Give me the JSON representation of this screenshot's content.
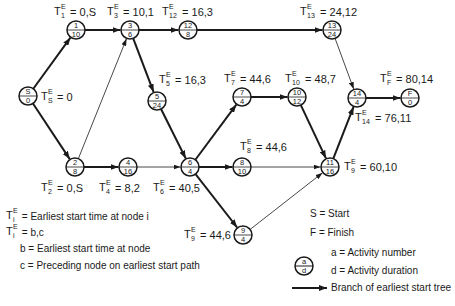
{
  "diagram": {
    "type": "network-earliest-start-tree",
    "nodes": [
      {
        "id": "S",
        "a": "S",
        "d": "0",
        "x": 28,
        "y": 96
      },
      {
        "id": "1",
        "a": "1",
        "d": "10",
        "x": 76,
        "y": 30
      },
      {
        "id": "2",
        "a": "2",
        "d": "8",
        "x": 75,
        "y": 167
      },
      {
        "id": "3",
        "a": "3",
        "d": "6",
        "x": 130,
        "y": 30
      },
      {
        "id": "12",
        "a": "12",
        "d": "8",
        "x": 188,
        "y": 30
      },
      {
        "id": "13",
        "a": "13",
        "d": "24",
        "x": 332,
        "y": 30
      },
      {
        "id": "5",
        "a": "5",
        "d": "24",
        "x": 157,
        "y": 101
      },
      {
        "id": "4",
        "a": "4",
        "d": "16",
        "x": 128,
        "y": 167
      },
      {
        "id": "6",
        "a": "6",
        "d": "4",
        "x": 190,
        "y": 167
      },
      {
        "id": "7",
        "a": "7",
        "d": "4",
        "x": 242,
        "y": 97
      },
      {
        "id": "10",
        "a": "10",
        "d": "12",
        "x": 297,
        "y": 97
      },
      {
        "id": "8",
        "a": "8",
        "d": "10",
        "x": 242,
        "y": 167
      },
      {
        "id": "11",
        "a": "11",
        "d": "16",
        "x": 330,
        "y": 167
      },
      {
        "id": "14",
        "a": "14",
        "d": "4",
        "x": 357,
        "y": 98
      },
      {
        "id": "F",
        "a": "F",
        "d": "0",
        "x": 410,
        "y": 98
      },
      {
        "id": "9",
        "a": "9",
        "d": "4",
        "x": 243,
        "y": 235
      }
    ],
    "edges": [
      {
        "from": "S",
        "to": "1",
        "tree": true
      },
      {
        "from": "S",
        "to": "2",
        "tree": true
      },
      {
        "from": "1",
        "to": "3",
        "tree": true
      },
      {
        "from": "2",
        "to": "3",
        "tree": false
      },
      {
        "from": "3",
        "to": "12",
        "tree": true
      },
      {
        "from": "12",
        "to": "13",
        "tree": true
      },
      {
        "from": "3",
        "to": "5",
        "tree": true
      },
      {
        "from": "2",
        "to": "4",
        "tree": true
      },
      {
        "from": "4",
        "to": "6",
        "tree": false
      },
      {
        "from": "5",
        "to": "6",
        "tree": true
      },
      {
        "from": "6",
        "to": "7",
        "tree": true
      },
      {
        "from": "6",
        "to": "8",
        "tree": true
      },
      {
        "from": "6",
        "to": "9",
        "tree": true
      },
      {
        "from": "7",
        "to": "10",
        "tree": true
      },
      {
        "from": "10",
        "to": "11",
        "tree": true
      },
      {
        "from": "8",
        "to": "11",
        "tree": false
      },
      {
        "from": "9",
        "to": "11",
        "tree": false
      },
      {
        "from": "13",
        "to": "14",
        "tree": false
      },
      {
        "from": "11",
        "to": "14",
        "tree": true
      },
      {
        "from": "14",
        "to": "F",
        "tree": true
      }
    ],
    "labels": [
      {
        "sub": "1",
        "value": "= 0,S",
        "x": 54,
        "y": 6
      },
      {
        "sub": "3",
        "value": "= 10,1",
        "x": 107,
        "y": 6
      },
      {
        "sub": "12",
        "value": "= 16,3",
        "x": 162,
        "y": 6
      },
      {
        "sub": "13",
        "value": "= 24,12",
        "x": 300,
        "y": 6
      },
      {
        "sub": "S",
        "value": "= 0",
        "x": 41,
        "y": 91
      },
      {
        "sub": "5",
        "value": "= 16,3",
        "x": 159,
        "y": 74
      },
      {
        "sub": "7",
        "value": "= 44,6",
        "x": 224,
        "y": 73
      },
      {
        "sub": "10",
        "value": "= 48,7",
        "x": 285,
        "y": 73
      },
      {
        "sub": "F",
        "value": "= 80,14",
        "x": 380,
        "y": 73
      },
      {
        "sub": "14",
        "value": "= 76,11",
        "x": 355,
        "y": 112
      },
      {
        "sub": "8",
        "value": "= 44,6",
        "x": 240,
        "y": 141
      },
      {
        "sub": "9",
        "value": "= 60,10",
        "x": 344,
        "y": 161
      },
      {
        "sub": "2",
        "value": "= 0,S",
        "x": 41,
        "y": 182
      },
      {
        "sub": "4",
        "value": "= 8,2",
        "x": 99,
        "y": 182
      },
      {
        "sub": "6",
        "value": "= 40,5",
        "x": 153,
        "y": 182
      },
      {
        "sub": "9",
        "value": "= 44,6",
        "x": 184,
        "y": 229
      }
    ],
    "colors": {
      "ink": "#1a1a1a",
      "background": "#ffffff"
    }
  },
  "legend_left": {
    "line1": {
      "sub": "i",
      "text": "= Earliest start time at node i"
    },
    "line2": {
      "sub": "i",
      "text": "= b,c"
    },
    "line3": "b = Earliest start time at node",
    "line4": "c = Preceding node on earliest start path"
  },
  "legend_right": {
    "start": "S = Start",
    "finish": "F = Finish",
    "node_a_symbol": "a",
    "node_d_symbol": "d",
    "activity_number": "a = Activity number",
    "activity_duration": "d = Activity duration",
    "tree_branch": "Branch of earliest start tree"
  }
}
